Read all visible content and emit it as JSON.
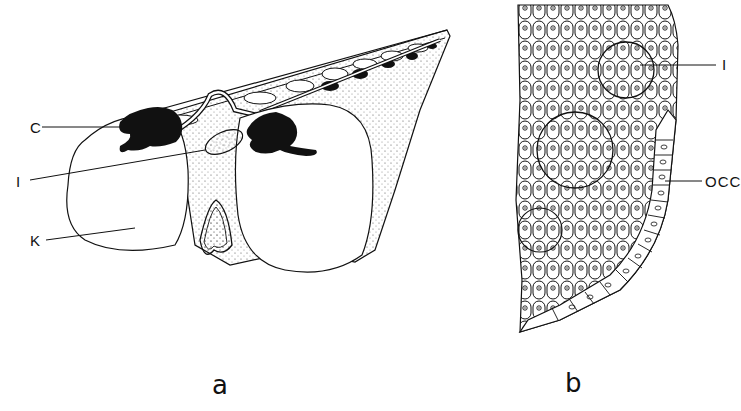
{
  "figure": {
    "panels": [
      {
        "id": "a",
        "caption": "a",
        "description": "Embryo head region, lateral view, with cranial ganglion, otic structure and kidney/eye-like vesicles",
        "labels": [
          {
            "text": "C",
            "x": 30,
            "y": 120
          },
          {
            "text": "I",
            "x": 16,
            "y": 174
          },
          {
            "text": "K",
            "x": 30,
            "y": 236
          }
        ]
      },
      {
        "id": "b",
        "caption": "b",
        "description": "Histological section showing cell rosettes and columnar epithelium",
        "labels": [
          {
            "text": "I",
            "x": 722,
            "y": 57
          },
          {
            "text": "OCC",
            "x": 706,
            "y": 174
          }
        ]
      }
    ]
  },
  "colors": {
    "ink": "#111111",
    "background": "#ffffff",
    "stipple": "#555555"
  }
}
